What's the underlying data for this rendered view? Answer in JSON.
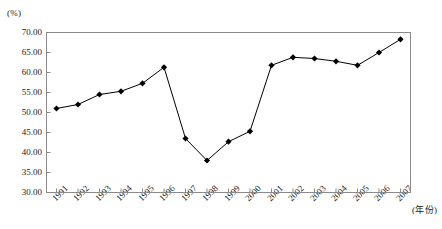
{
  "chart_data": {
    "type": "line",
    "title": "",
    "xlabel": "(年份)",
    "ylabel": "(%)",
    "ylim": [
      30.0,
      70.0
    ],
    "ytick_step": 5.0,
    "yticks": [
      "70.00",
      "65.00",
      "60.00",
      "55.00",
      "50.00",
      "45.00",
      "40.00",
      "35.00",
      "30.00"
    ],
    "ytick_values": [
      70.0,
      65.0,
      60.0,
      55.0,
      50.0,
      45.0,
      40.0,
      35.0,
      30.0
    ],
    "categories": [
      "1991",
      "1992",
      "1993",
      "1994",
      "1995",
      "1996",
      "1997",
      "1998",
      "1999",
      "2000",
      "2001",
      "2002",
      "2003",
      "2004",
      "2005",
      "2006",
      "2007"
    ],
    "values": [
      51.0,
      52.0,
      54.5,
      55.3,
      57.3,
      61.3,
      43.5,
      38.0,
      42.7,
      45.3,
      61.8,
      63.8,
      63.5,
      62.8,
      61.8,
      65.0,
      68.3
    ],
    "grid": false,
    "legend": "none",
    "marker": "diamond",
    "line_color": "#000000",
    "marker_color": "#000000",
    "axis_color": "#808080"
  }
}
